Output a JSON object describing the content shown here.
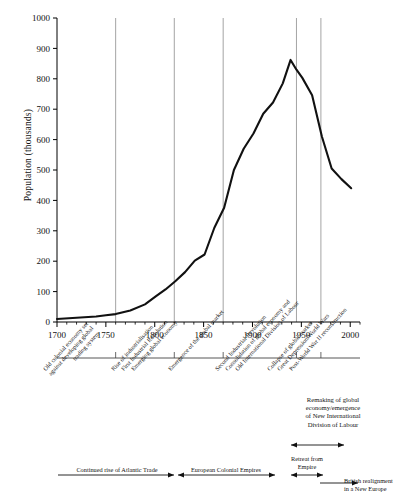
{
  "chart_data": {
    "type": "line",
    "title": "",
    "xlabel": "",
    "ylabel": "Population (thousands)",
    "xlim": [
      1700,
      2010
    ],
    "ylim": [
      0,
      1000
    ],
    "grid": false,
    "legend": "none",
    "y_ticks": [
      0,
      100,
      200,
      300,
      400,
      500,
      600,
      700,
      800,
      900,
      1000
    ],
    "x_ticks": [
      1700,
      1750,
      1800,
      1850,
      1900,
      1950,
      2000
    ],
    "x_minor_tick_step": 10,
    "series": [
      {
        "name": "Population",
        "x": [
          1700,
          1720,
          1740,
          1750,
          1760,
          1775,
          1790,
          1801,
          1811,
          1821,
          1831,
          1841,
          1851,
          1861,
          1871,
          1881,
          1891,
          1901,
          1911,
          1921,
          1931,
          1939,
          1945,
          1951,
          1961,
          1971,
          1981,
          1991,
          2001
        ],
        "values": [
          10,
          14,
          18,
          22,
          26,
          38,
          58,
          84,
          107,
          134,
          164,
          202,
          222,
          310,
          376,
          500,
          570,
          620,
          685,
          722,
          785,
          862,
          830,
          803,
          746,
          610,
          505,
          470,
          440
        ]
      }
    ],
    "era_dividers": [
      1760,
      1820,
      1870,
      1945,
      1970
    ]
  },
  "axis": {
    "y_title": "Population (thousands)",
    "y_labels": [
      "1000",
      "900",
      "800",
      "700",
      "600",
      "500",
      "400",
      "300",
      "200",
      "100",
      "0"
    ],
    "x_labels": [
      "1700",
      "1750",
      "1800",
      "1850",
      "1900",
      "1950",
      "2000"
    ]
  },
  "eras": {
    "rotated": [
      {
        "name": "era-old-colonial-economy",
        "lines": [
          "Old colonial economy set",
          "against developing global",
          "trading system"
        ]
      },
      {
        "name": "era-rise-of-industrialisation",
        "lines": [
          "Rise of industrialisation"
        ]
      },
      {
        "name": "era-first-industrial-revolution",
        "lines": [
          "First Industrial Revolution"
        ]
      },
      {
        "name": "era-emerging-global-economy",
        "lines": [
          "Emerging global economy"
        ]
      },
      {
        "name": "era-emergence-global-market",
        "lines": [
          "Emergence of the global market"
        ]
      },
      {
        "name": "era-second-industrial-revolution",
        "lines": [
          "Second Industrial Revolution"
        ]
      },
      {
        "name": "era-consolidation-global-economy",
        "lines": [
          "Consolidation of global economy and"
        ]
      },
      {
        "name": "era-old-international-division-of-labour",
        "lines": [
          "Old International Division of Labour"
        ]
      },
      {
        "name": "era-collapse-of-global-market",
        "lines": [
          "Collapse of global market"
        ]
      },
      {
        "name": "era-great-depression-world-wars",
        "lines": [
          "Great Depression/World Wars"
        ]
      },
      {
        "name": "era-post-world-war-two-reconstruction",
        "lines": [
          "Post-World War II reconstruction"
        ]
      }
    ],
    "block": {
      "name": "era-remaking-of-global-economy",
      "lines": [
        "Remaking of global",
        "economy/emergence",
        "of New International",
        "Division of Labour"
      ]
    }
  },
  "timeline": {
    "atlantic_trade": "Continued rise of Atlantic Trade",
    "colonial_empires": "European Colonial Empires",
    "retreat_from_empire_line1": "Retreat from",
    "retreat_from_empire_line2": "Empire",
    "new_europe_line1": "British realignment",
    "new_europe_line2": "in a New Europe"
  },
  "colors": {
    "line": "#111111",
    "axis": "#000000",
    "divider": "#8d8d8d",
    "background": "#ffffff"
  }
}
